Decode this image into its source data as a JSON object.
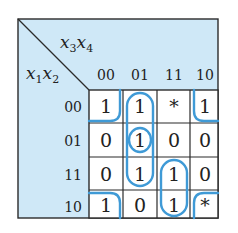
{
  "colors": {
    "header_bg": "#cfe8f7",
    "cell_bg": "#ffffff",
    "grid_line": "#2b2b2b",
    "group_outline": "#3f9ad6",
    "text": "#222222"
  },
  "axes": {
    "column_variables": "x3x4",
    "row_variables": "x1x2",
    "column_var_parts": [
      {
        "base": "x",
        "sub": "3"
      },
      {
        "base": "x",
        "sub": "4"
      }
    ],
    "row_var_parts": [
      {
        "base": "x",
        "sub": "1"
      },
      {
        "base": "x",
        "sub": "2"
      }
    ],
    "column_labels": [
      "00",
      "01",
      "11",
      "10"
    ],
    "row_labels": [
      "00",
      "01",
      "11",
      "10"
    ]
  },
  "cells": [
    [
      "1",
      "1",
      "*",
      "1"
    ],
    [
      "0",
      "1",
      "0",
      "0"
    ],
    [
      "0",
      "1",
      "1",
      "0"
    ],
    [
      "1",
      "0",
      "1",
      "*"
    ]
  ],
  "groups": [
    {
      "name": "corners",
      "cells": [
        [
          0,
          0
        ],
        [
          0,
          3
        ],
        [
          3,
          0
        ],
        [
          3,
          3
        ]
      ],
      "description": "four-corner wrap-around group"
    },
    {
      "name": "column-01-vertical",
      "cells": [
        [
          0,
          1
        ],
        [
          1,
          1
        ],
        [
          2,
          1
        ]
      ],
      "description": "vertical loop in column 01, rows 00-11"
    },
    {
      "name": "single-01-01",
      "cells": [
        [
          1,
          1
        ]
      ],
      "description": "circle around row 01 column 01"
    },
    {
      "name": "column-11-lower",
      "cells": [
        [
          2,
          2
        ],
        [
          3,
          2
        ]
      ],
      "description": "vertical loop in column 11, rows 11-10"
    }
  ]
}
